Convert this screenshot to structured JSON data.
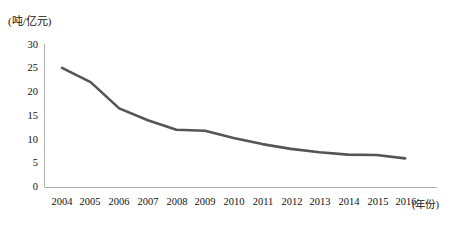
{
  "chart_data": {
    "type": "line",
    "title": "",
    "subtitle": "",
    "xlabel": "(年份)",
    "ylabel": "(吨/亿元)",
    "unit_label": "(吨/亿元)",
    "categories": [
      "2004",
      "2005",
      "2006",
      "2007",
      "2008",
      "2009",
      "2010",
      "2011",
      "2012",
      "2013",
      "2014",
      "2015",
      "2016"
    ],
    "values": [
      25.0,
      22.0,
      16.5,
      14.0,
      12.0,
      11.8,
      10.3,
      9.0,
      8.0,
      7.3,
      6.8,
      6.7,
      6.0
    ],
    "series": [
      {
        "name": "能耗强度",
        "values": [
          25.0,
          22.0,
          16.5,
          14.0,
          12.0,
          11.8,
          10.3,
          9.0,
          8.0,
          7.3,
          6.8,
          6.7,
          6.0
        ]
      }
    ],
    "ylim": [
      0,
      30
    ],
    "yticks": [
      0,
      5,
      10,
      15,
      20,
      25,
      30
    ],
    "ytick_labels": [
      "0",
      "5",
      "10",
      "15",
      "20",
      "25",
      "30"
    ],
    "xtick_labels": [
      "2004",
      "2005",
      "2006",
      "2007",
      "2008",
      "2009",
      "2010",
      "2011",
      "2012",
      "2013",
      "2014",
      "2015",
      "2016"
    ],
    "grid": false,
    "legend": null,
    "legend_position": "none",
    "line_color": "#555555",
    "axis_color": "#b0b0b0",
    "text_color": "#111111",
    "annotations": []
  },
  "axes": {
    "y_unit": "(吨/亿元)",
    "x_unit": "(年份)"
  }
}
